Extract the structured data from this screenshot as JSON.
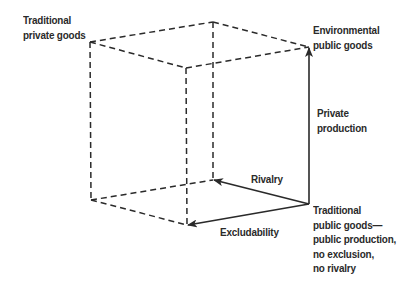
{
  "diagram": {
    "type": "cube-diagram",
    "colors": {
      "line": "#2a2a2a",
      "text": "#2a2a2a",
      "background": "#ffffff"
    },
    "vertices": {
      "left_top": [
        90,
        42
      ],
      "back_top": [
        213,
        22
      ],
      "right_top": [
        309,
        47
      ],
      "front_top": [
        186,
        68
      ],
      "left_bottom": [
        91,
        200
      ],
      "back_bottom": [
        213,
        180
      ],
      "right_bottom": [
        309,
        204
      ],
      "front_bottom": [
        187,
        225
      ]
    },
    "labels": {
      "traditional_private_goods": [
        "Traditional",
        "private goods"
      ],
      "environmental_public_goods": [
        "Environmental",
        "public goods"
      ],
      "private_production": [
        "Private",
        "production"
      ],
      "rivalry": [
        "Rivalry"
      ],
      "excludability": [
        "Excludability"
      ],
      "traditional_public_goods": [
        "Traditional",
        "public goods—",
        "public production,",
        "no exclusion,",
        "no rivalry"
      ]
    },
    "arrows": [
      {
        "name": "private-production-arrow",
        "from": "right_bottom",
        "to": "right_top",
        "label": "Private production"
      },
      {
        "name": "rivalry-arrow",
        "from": "right_bottom",
        "to": "back_bottom",
        "label": "Rivalry"
      },
      {
        "name": "excludability-arrow",
        "from": "right_bottom",
        "to": "front_bottom",
        "label": "Excludability"
      }
    ]
  }
}
